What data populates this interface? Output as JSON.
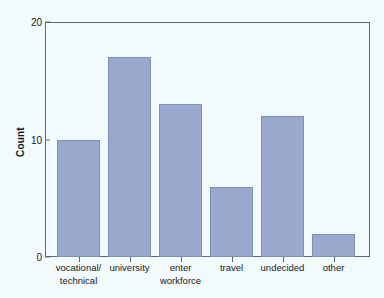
{
  "chart_data": {
    "type": "bar",
    "title": "",
    "xlabel": "",
    "ylabel": "Count",
    "categories": [
      "vocational/ technical",
      "university",
      "enter workforce",
      "travel",
      "undecided",
      "other"
    ],
    "category_lines": [
      [
        "vocational/",
        "technical"
      ],
      [
        "university"
      ],
      [
        "enter",
        "workforce"
      ],
      [
        "travel"
      ],
      [
        "undecided"
      ],
      [
        "other"
      ]
    ],
    "values": [
      10,
      17,
      13,
      6,
      12,
      2
    ],
    "ylim": [
      0,
      20
    ],
    "yticks": [
      0,
      10,
      20
    ],
    "ytick_labels": [
      "0",
      "10",
      "20"
    ],
    "grid": false,
    "legend": "none",
    "colors": {
      "bar_fill": "#98a9cd",
      "bar_edge": "#7f90b8",
      "axis": "#5c6b73",
      "text": "#1a1a1a",
      "background": "#f2fafb"
    }
  }
}
